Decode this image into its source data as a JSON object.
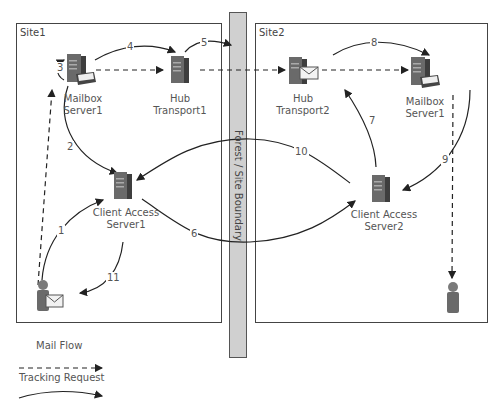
{
  "sites": [
    {
      "label": "Site1"
    },
    {
      "label": "Site2"
    }
  ],
  "boundary": {
    "label": "Forest / Site Boundary"
  },
  "nodes": {
    "mailbox1": {
      "line1": "Mailbox",
      "line2": "Server1"
    },
    "hub1": {
      "line1": "Hub",
      "line2": "Transport1"
    },
    "cas1": {
      "line1": "Client Access",
      "line2": "Server1"
    },
    "hub2": {
      "line1": "Hub",
      "line2": "Transport2"
    },
    "mailbox2": {
      "line1": "Mailbox",
      "line2": "Server1"
    },
    "cas2": {
      "line1": "Client Access",
      "line2": "Server2"
    }
  },
  "steps": [
    "1",
    "2",
    "3",
    "4",
    "5",
    "6",
    "7",
    "8",
    "9",
    "10",
    "11"
  ],
  "legend": {
    "mail_flow": "Mail Flow",
    "tracking_request": "Tracking Request"
  },
  "colors": {
    "boundary_fill": "#d0d0d0",
    "line": "#222222",
    "server": "#555555"
  }
}
